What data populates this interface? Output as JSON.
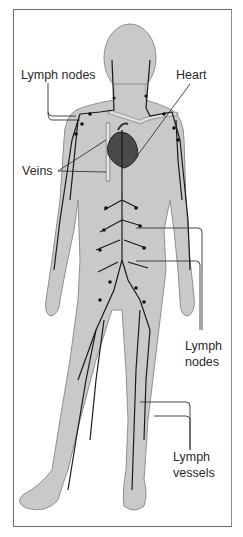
{
  "diagram": {
    "labels": {
      "lymph_nodes_upper": "Lymph nodes",
      "heart": "Heart",
      "veins": "Veins",
      "lymph_nodes_lower_1": "Lymph",
      "lymph_nodes_lower_2": "nodes",
      "lymph_vessels_1": "Lymph",
      "lymph_vessels_2": "vessels"
    },
    "colors": {
      "body_fill": "#c9c9c9",
      "body_outline": "#8f8f8f",
      "vessel": "#1a1a1a",
      "heart": "#4a4a4a",
      "vein": "#b0b0b0",
      "frame": "#6a6a6a"
    }
  }
}
